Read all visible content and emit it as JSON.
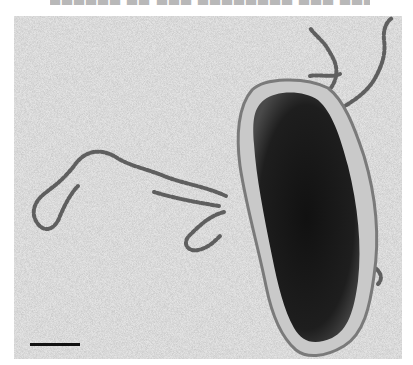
{
  "figure": {
    "type": "transmission electron micrograph",
    "header_text_cropped": true,
    "scale_bar": {
      "label": "",
      "length_px": 50
    },
    "colors": {
      "background_grain": "#d9d9d9",
      "cell_body": "#1a1a1a",
      "cell_envelope": "#8a8a8a",
      "filaments": "#6b6b6b",
      "scale_bar": "#111111"
    }
  }
}
